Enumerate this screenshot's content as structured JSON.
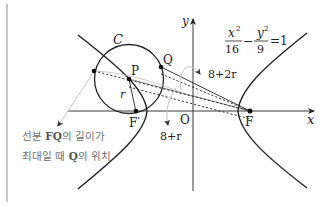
{
  "diagram": {
    "equation": {
      "x_num": "x",
      "x_exp": "2",
      "x_den": "16",
      "minus": "−",
      "y_num": "y",
      "y_exp": "2",
      "y_den": "9",
      "rhs": "=1"
    },
    "labels": {
      "circle": "C",
      "P": "P",
      "Q": "Q",
      "r": "r",
      "F_prime": "F′",
      "F": "F",
      "origin": "O",
      "x_axis": "x",
      "y_axis": "y",
      "dist_max": "8+2r",
      "dist_center": "8+r"
    },
    "annotation": {
      "line1_pre": "선분 ",
      "line1_bold": "FQ",
      "line1_post": "의 길이가",
      "line2_pre": "최대일 때 ",
      "line2_bold": "Q",
      "line2_post": "의 위치"
    },
    "colors": {
      "ink": "#222222",
      "leader": "#c4c4c4",
      "note": "#6e6e6e"
    }
  }
}
